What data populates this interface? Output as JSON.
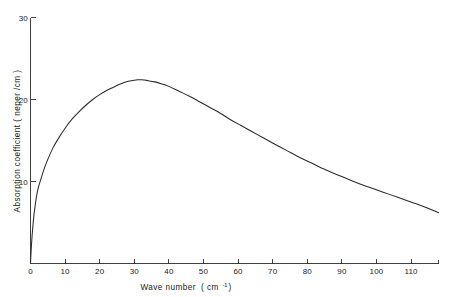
{
  "chart_data": {
    "type": "line",
    "title": "",
    "subtitle": "",
    "xlabel": "Wave number",
    "xlabel_unit": "( cm",
    "xlabel_unit_sup": "-1",
    "xlabel_unit_close": ")",
    "xlabel_full": "Wave number ( cm-1 )",
    "ylabel": "Absorption coefficient ( neper /cm )",
    "xlim": [
      0,
      118
    ],
    "ylim": [
      0,
      30
    ],
    "xticks": [
      0,
      10,
      20,
      30,
      40,
      50,
      60,
      70,
      80,
      90,
      100,
      110
    ],
    "xticklabels": [
      "0",
      "10",
      "20",
      "30",
      "40",
      "50",
      "60",
      "70",
      "80",
      "90",
      "100",
      "110"
    ],
    "yticks": [
      10,
      20,
      30
    ],
    "yticklabels": [
      "10",
      "20",
      "30"
    ],
    "grid": false,
    "legend": false,
    "legend_position": "none",
    "series": [
      {
        "name": "Absorption coefficient",
        "color": "#2a2a2a",
        "x": [
          0,
          0.3,
          0.7,
          1.2,
          2,
          3,
          4,
          5,
          6.5,
          8,
          10,
          12,
          14,
          16,
          18,
          20,
          22,
          24,
          26,
          28,
          30,
          31,
          32,
          34,
          36,
          38,
          40,
          43,
          46,
          49,
          52,
          55,
          58,
          61,
          64,
          67,
          70,
          74,
          78,
          82,
          86,
          90,
          94,
          98,
          102,
          106,
          110,
          114,
          118
        ],
        "y": [
          0,
          2.4,
          4.6,
          6.6,
          8.8,
          10.3,
          11.6,
          12.7,
          14.1,
          15.2,
          16.5,
          17.6,
          18.5,
          19.3,
          20.0,
          20.6,
          21.1,
          21.5,
          21.9,
          22.2,
          22.35,
          22.4,
          22.4,
          22.3,
          22.15,
          21.9,
          21.6,
          21.0,
          20.4,
          19.7,
          19.0,
          18.3,
          17.5,
          16.8,
          16.1,
          15.4,
          14.7,
          13.8,
          12.9,
          12.1,
          11.3,
          10.6,
          9.9,
          9.3,
          8.7,
          8.1,
          7.5,
          6.9,
          6.2
        ]
      }
    ],
    "peak": {
      "x": 31,
      "y": 22.4
    },
    "annotations": []
  },
  "figure": {
    "background_color": "#ffffff",
    "axis_color": "#2b2b2b",
    "curve_color": "#2a2a2a"
  }
}
